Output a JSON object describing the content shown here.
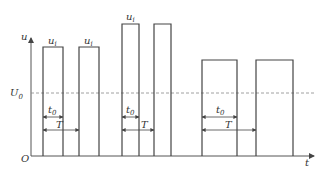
{
  "diagram": {
    "title": "",
    "axes": {
      "y_label": "u",
      "x_label": "t",
      "origin_label": "O",
      "reference_level_label": "U",
      "reference_level_subscript": "0"
    },
    "pulse_label": {
      "main": "u",
      "subscript": "i"
    },
    "dimension_labels": {
      "pulse_width": {
        "main": "t",
        "subscript": "0"
      },
      "period": {
        "main": "T"
      }
    },
    "groups": [
      {
        "name": "group-1",
        "amplitude_relative": 0.83,
        "duty_relative": 0.55,
        "pulses": 2,
        "labeled_pulses": [
          0,
          1
        ]
      },
      {
        "name": "group-2",
        "amplitude_relative": 1.0,
        "duty_relative": 0.53,
        "pulses": 2,
        "labeled_pulses": [
          0
        ]
      },
      {
        "name": "group-3",
        "amplitude_relative": 0.73,
        "duty_relative": 0.65,
        "pulses": 2,
        "labeled_pulses": []
      }
    ]
  }
}
